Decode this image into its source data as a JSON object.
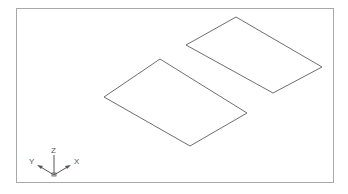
{
  "viewport": {
    "view": "isometric",
    "frame_color": "#a8a8a8",
    "line_color": "#6e6e6e"
  },
  "shapes": [
    {
      "name": "left-plane",
      "points": "104,97 160,59 247,113 190,146"
    },
    {
      "name": "right-plane",
      "points": "186,45 236,17 322,67 273,93"
    }
  ],
  "ucs_icon": {
    "z_label": "Z",
    "y_label": "Y",
    "x_label": "X"
  }
}
